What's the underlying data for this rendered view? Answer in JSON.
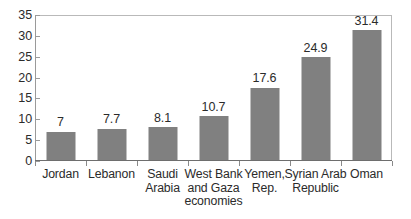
{
  "chart_data": {
    "type": "bar",
    "title": "",
    "subtitle": "",
    "xlabel": "",
    "ylabel": "",
    "ylim": [
      0,
      35
    ],
    "yticks": [
      0,
      5,
      10,
      15,
      20,
      25,
      30,
      35
    ],
    "ytick_labels": [
      "0",
      "5",
      "10",
      "15",
      "20",
      "25",
      "30",
      "35"
    ],
    "grid": false,
    "legend": null,
    "legend_position": "none",
    "bar_color": "#808080",
    "axis_color": "#6e6e6e",
    "frame_color": "#b9b9b9",
    "text_color": "#2b2b2b",
    "categories": [
      "Jordan",
      "Lebanon",
      "Saudi Arabia",
      "West Bank and Gaza economies",
      "Yemen, Rep.",
      "Syrian Arab Republic",
      "Oman"
    ],
    "category_label_lines": [
      [
        "Jordan"
      ],
      [
        "Lebanon"
      ],
      [
        "Saudi",
        "Arabia"
      ],
      [
        "West Bank",
        "and Gaza",
        "economies"
      ],
      [
        "Yemen,",
        "Rep."
      ],
      [
        "Syrian Arab",
        "Republic"
      ],
      [
        "Oman"
      ]
    ],
    "values": [
      7,
      7.7,
      8.1,
      10.7,
      17.6,
      24.9,
      31.4
    ],
    "value_labels": [
      "7",
      "7.7",
      "8.1",
      "10.7",
      "17.6",
      "24.9",
      "31.4"
    ]
  }
}
